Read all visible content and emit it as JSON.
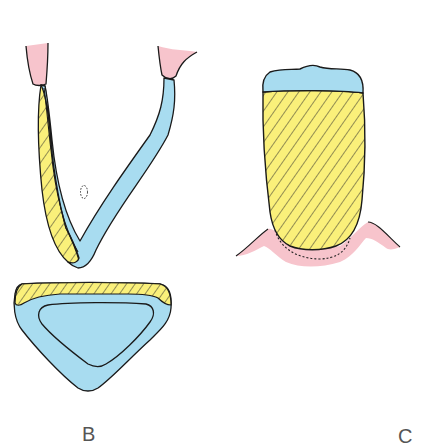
{
  "figure": {
    "panels": [
      {
        "id": "B",
        "label": "B",
        "parts": [
          "v-shaped-section",
          "triangular-cross-section"
        ]
      },
      {
        "id": "C",
        "label": "C",
        "parts": [
          "crown-with-blue-cap",
          "gum-tissue",
          "dotted-outline"
        ]
      }
    ]
  },
  "colors": {
    "pink": "#f7c4cc",
    "blue": "#a8dcf0",
    "yellow": "#faf07a",
    "outline": "#1a1a1a",
    "label": "#555555"
  }
}
